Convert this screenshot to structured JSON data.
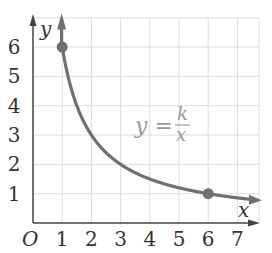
{
  "chart_data": {
    "type": "line",
    "title": "",
    "function": "y = k/x",
    "k": 6,
    "xlabel": "x",
    "ylabel": "y",
    "origin_label": "O",
    "xlim": [
      0,
      7.8
    ],
    "ylim": [
      0,
      7
    ],
    "x_ticks": [
      "1",
      "2",
      "3",
      "4",
      "5",
      "6",
      "7"
    ],
    "y_ticks": [
      "1",
      "2",
      "3",
      "4",
      "5",
      "6"
    ],
    "grid": true,
    "annotation": {
      "text_lhs": "y =",
      "numerator": "k",
      "denominator": "x",
      "x": 4.7,
      "y": 3.2
    },
    "highlighted_points": [
      {
        "x": 1,
        "y": 6
      },
      {
        "x": 6,
        "y": 1
      }
    ],
    "curve_x_range": [
      0.96,
      7.6
    ],
    "series": [
      {
        "name": "y = k/x",
        "x": [
          1,
          1.5,
          2,
          3,
          4,
          5,
          6,
          7
        ],
        "values": [
          6,
          4,
          3,
          2,
          1.5,
          1.2,
          1,
          0.857
        ]
      }
    ]
  },
  "colors": {
    "curve": "#707070",
    "point": "#707070",
    "axis": "#444444",
    "grid": "#dddddd",
    "equation": "#9a9a9a"
  }
}
